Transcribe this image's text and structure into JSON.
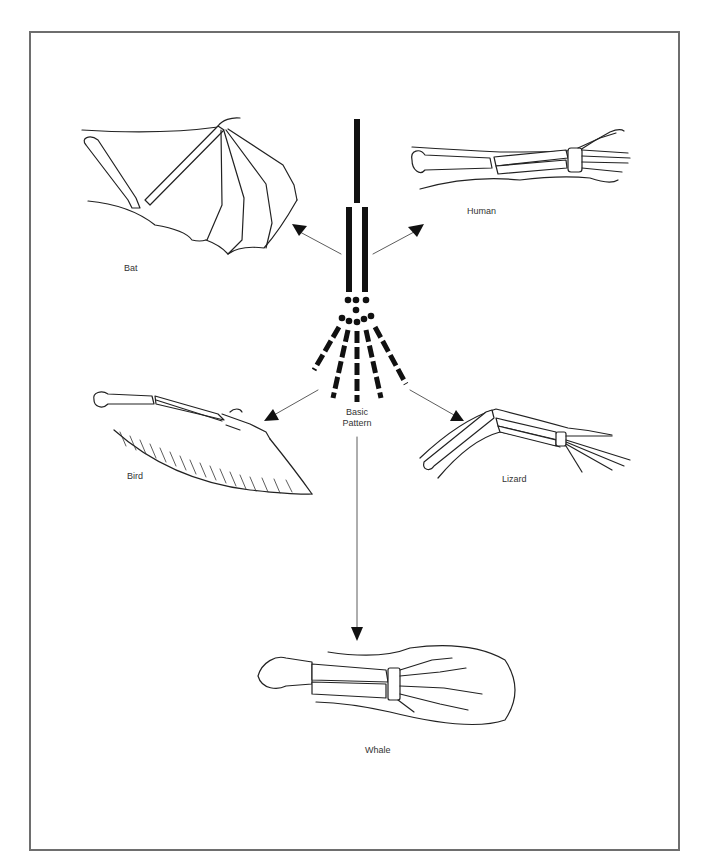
{
  "figure": {
    "center": {
      "label_line1": "Basic",
      "label_line2": "Pattern"
    },
    "animals": [
      {
        "id": "bat",
        "label": "Bat"
      },
      {
        "id": "human",
        "label": "Human"
      },
      {
        "id": "bird",
        "label": "Bird"
      },
      {
        "id": "lizard",
        "label": "Lizard"
      },
      {
        "id": "whale",
        "label": "Whale"
      }
    ],
    "colors": {
      "ink": "#111111",
      "border": "#6e6e6e",
      "background": "#ffffff"
    }
  }
}
